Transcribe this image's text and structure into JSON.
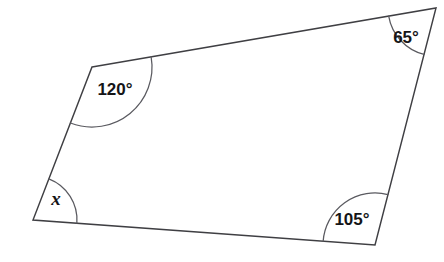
{
  "figure": {
    "type": "geometry-diagram",
    "shape": "quadrilateral",
    "background_color": "#ffffff",
    "stroke_color": "#3f3f43",
    "arc_color": "#5a5a60",
    "label_color": "#151517",
    "width": 444,
    "height": 262
  },
  "chart_data": {
    "type": "diagram",
    "title": "",
    "shape": "quadrilateral",
    "vertices": [
      {
        "id": "A",
        "position": "top-left",
        "x": 92,
        "y": 67
      },
      {
        "id": "B",
        "position": "top-right",
        "x": 436,
        "y": 8
      },
      {
        "id": "C",
        "position": "bottom-right",
        "x": 375,
        "y": 245
      },
      {
        "id": "D",
        "position": "bottom-left",
        "x": 33,
        "y": 220
      }
    ],
    "edges": [
      {
        "from": "A",
        "to": "B"
      },
      {
        "from": "B",
        "to": "C"
      },
      {
        "from": "C",
        "to": "D"
      },
      {
        "from": "D",
        "to": "A"
      }
    ],
    "angles": [
      {
        "vertex": "A",
        "label": "120°",
        "value": 120,
        "unknown": false,
        "arc_radius": 60,
        "label_x": 115,
        "label_y": 91
      },
      {
        "vertex": "B",
        "label": "65°",
        "value": 65,
        "unknown": false,
        "arc_radius": 48,
        "label_x": 406,
        "label_y": 39
      },
      {
        "vertex": "C",
        "label": "105°",
        "value": 105,
        "unknown": false,
        "arc_radius": 52,
        "label_x": 352,
        "label_y": 221
      },
      {
        "vertex": "D",
        "label": "x",
        "value": null,
        "unknown": true,
        "arc_radius": 44,
        "label_x": 56,
        "label_y": 201
      }
    ],
    "angle_sum": 360,
    "units": "degrees"
  },
  "labels": {
    "angle_a": "120°",
    "angle_b": "65°",
    "angle_c": "105°",
    "angle_d": "x"
  }
}
